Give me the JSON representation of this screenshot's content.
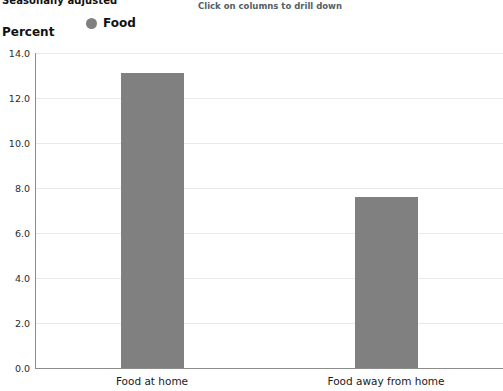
{
  "header": {
    "title_clipped": "Seasonally adjusted",
    "drilldown_hint": "Click on columns to drill down"
  },
  "legend": {
    "series_label": "Food",
    "marker_color": "#808080"
  },
  "axis": {
    "y_title": "Percent"
  },
  "chart_data": {
    "type": "bar",
    "title": "Seasonally adjusted",
    "xlabel": "",
    "ylabel": "Percent",
    "ylim": [
      0.0,
      14.0
    ],
    "ytick_step": 2.0,
    "ytick_labels": [
      "0.0",
      "2.0",
      "4.0",
      "6.0",
      "8.0",
      "10.0",
      "12.0",
      "14.0"
    ],
    "ytick_values": [
      0.0,
      2.0,
      4.0,
      6.0,
      8.0,
      10.0,
      12.0,
      14.0
    ],
    "grid": true,
    "legend_position": "top-left",
    "categories": [
      "Food at home",
      "Food away from home"
    ],
    "series": [
      {
        "name": "Food",
        "color": "#808080",
        "values": [
          13.1,
          7.6
        ]
      }
    ],
    "annotations": [
      "Click on columns to drill down"
    ]
  }
}
